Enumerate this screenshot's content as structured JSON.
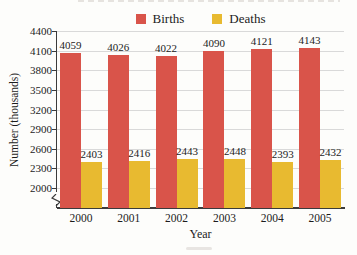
{
  "chart_data": {
    "type": "bar",
    "title": "",
    "categories": [
      "2000",
      "2001",
      "2002",
      "2003",
      "2004",
      "2005"
    ],
    "series": [
      {
        "name": "Births",
        "color": "#d9544a",
        "values": [
          4059,
          4026,
          4022,
          4090,
          4121,
          4143
        ]
      },
      {
        "name": "Deaths",
        "color": "#e8ba30",
        "values": [
          2403,
          2416,
          2443,
          2448,
          2393,
          2432
        ]
      }
    ],
    "xlabel": "Year",
    "ylabel": "Number (thousands)",
    "yticks": [
      4400,
      4100,
      3800,
      3500,
      3200,
      2900,
      2600,
      2300,
      2000
    ],
    "ylim": [
      2000,
      4400
    ],
    "axis_break": true,
    "grid": true,
    "legend_position": "top",
    "data_labels": true,
    "colors": {
      "grid": "#d9d9d9",
      "axis": "#3b3b3b",
      "text": "#1c1c1c"
    }
  }
}
